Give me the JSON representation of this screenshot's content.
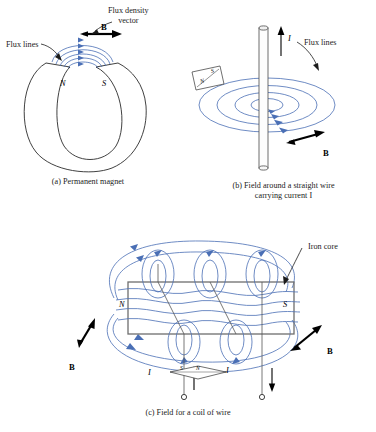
{
  "figure": {
    "title_text": "",
    "colors": {
      "flux_blue": "#4a6fb5",
      "outline_black": "#2b2b2b",
      "core_gray": "#6e6e6e",
      "text_black": "#1c1c1c"
    }
  },
  "panel_a": {
    "caption": "(a) Permanent magnet",
    "labels": {
      "flux_lines": "Flux lines",
      "flux_density_vector": "Flux density\nvector",
      "b_vector": "B",
      "pole_north": "N",
      "pole_south": "S"
    },
    "icons": {
      "leader_flux_lines": "leader-arrow-icon",
      "leader_flux_density": "leader-arrow-icon",
      "b_arrow": "vector-arrow-icon"
    },
    "flux_arc_count": 5,
    "flux_arrow_count": 5
  },
  "panel_b": {
    "caption": "(b) Field around a straight wire\ncarrying current I",
    "labels": {
      "flux_lines": "Flux lines",
      "current": "I",
      "b_vector": "B",
      "compass_north": "N",
      "compass_south": "S"
    },
    "icons": {
      "wire": "cylinder-wire-icon",
      "current_arrow": "up-arrow-icon",
      "leader_flux_lines": "leader-arrow-icon",
      "b_arrow": "vector-arrow-icon",
      "compass": "compass-card-icon"
    },
    "flux_ring_count": 4
  },
  "panel_c": {
    "caption": "(c) Field for a coil of wire",
    "labels": {
      "iron_core": "Iron core",
      "pole_north": "N",
      "pole_south": "S",
      "b_vector_left": "B",
      "b_vector_right": "B",
      "current_left": "I",
      "current_right": "I",
      "compass_south": "S",
      "compass_north": "N"
    },
    "icons": {
      "core_rect": "iron-core-icon",
      "leader_iron_core": "leader-arrow-icon",
      "b_arrow_left": "vector-arrow-icon",
      "b_arrow_right": "vector-arrow-icon",
      "current_arrow_left": "up-arrow-icon",
      "current_arrow_right": "down-arrow-icon",
      "terminal_left": "terminal-circle-icon",
      "terminal_right": "terminal-circle-icon",
      "compass": "compass-diamond-icon"
    },
    "coil_turn_count": 3,
    "flux_loop_count": 4
  }
}
